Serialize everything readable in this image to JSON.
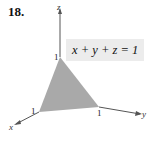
{
  "exercise": {
    "number": "18."
  },
  "equation": "x + y + z = 1",
  "axes": {
    "x": "x",
    "y": "y",
    "z": "z"
  },
  "intercepts": {
    "x": "1",
    "y": "1",
    "z": "1"
  },
  "colors": {
    "plane_fill": "#a9a9a9",
    "axis": "#555555",
    "label_bg": "#ececec"
  }
}
